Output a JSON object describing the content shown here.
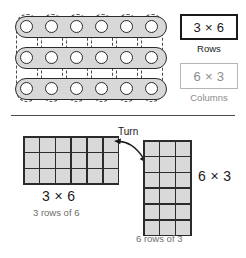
{
  "figure": {
    "title_implied": "Array rows and columns: 3 x 6 and 6 x 3",
    "top": {
      "array": {
        "rows": 3,
        "columns": 6,
        "dot_count": 18,
        "row_grouping_style": "solid grey capsule",
        "column_grouping_style": "dashed capsule"
      },
      "legend": {
        "primary_expression": "3 × 6",
        "primary_caption": "Rows",
        "secondary_expression": "6 × 3",
        "secondary_caption": "Columns"
      }
    },
    "bottom": {
      "left_grid": {
        "columns": 6,
        "rows": 3,
        "expression": "3 × 6",
        "description": "3 rows of 6"
      },
      "right_grid": {
        "columns": 3,
        "rows": 6,
        "expression": "6 × 3",
        "description": "6 rows of 3"
      },
      "turn_label": "Turn"
    }
  },
  "colors": {
    "ink": "#1a1a1a",
    "muted": "#8c8c8c",
    "cell_fill": "#d9d9d9",
    "capsule_fill": "#d8d8d8",
    "grid_line": "#2b2b2b",
    "dashed_outline": "#4a4a4a"
  },
  "icons": {
    "turn_arrow": "double-headed-curved-arrow"
  }
}
